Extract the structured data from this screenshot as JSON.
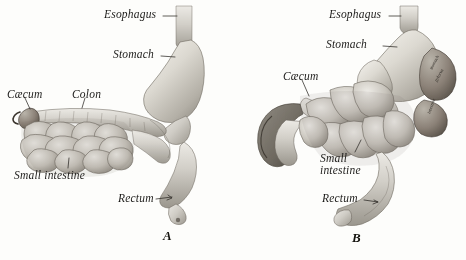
{
  "plate": {
    "background_color": "#fdfdfb",
    "ink_color": "#1d1c1a",
    "medium": "halftone engraving",
    "subject": "comparative digestive tract anatomy",
    "panel_count": 2
  },
  "figures": [
    {
      "caption": "A",
      "caption_x": 163,
      "caption_y": 232,
      "labels": [
        {
          "text": "Esophagus",
          "x": 104,
          "y": 12,
          "anchor_x": 176,
          "anchor_y": 18,
          "leader": "dash-right"
        },
        {
          "text": "Stomach",
          "x": 113,
          "y": 52,
          "anchor_x": 176,
          "anchor_y": 58,
          "leader": "dash-right"
        },
        {
          "text": "Cæcum",
          "x": 7,
          "y": 92,
          "anchor_x": 28,
          "anchor_y": 112,
          "leader": "down-right"
        },
        {
          "text": "Colon",
          "x": 72,
          "y": 92,
          "anchor_x": 84,
          "anchor_y": 110,
          "leader": "down-left"
        },
        {
          "text": "Small intestine",
          "x": 14,
          "y": 172,
          "anchor_x": 68,
          "anchor_y": 162,
          "leader": "up"
        },
        {
          "text": "Rectum",
          "x": 122,
          "y": 196,
          "anchor_x": 172,
          "anchor_y": 198,
          "leader": "dash-right"
        }
      ]
    },
    {
      "caption": "B",
      "caption_x": 352,
      "caption_y": 234,
      "labels": [
        {
          "text": "Esophagus",
          "x": 330,
          "y": 12,
          "anchor_x": 400,
          "anchor_y": 18,
          "leader": "dash-right"
        },
        {
          "text": "Stomach",
          "x": 327,
          "y": 42,
          "anchor_x": 392,
          "anchor_y": 48,
          "leader": "dash-right"
        },
        {
          "text": "Cæcum",
          "x": 283,
          "y": 74,
          "anchor_x": 307,
          "anchor_y": 96,
          "leader": "down-right"
        },
        {
          "text": "Small",
          "text_line2": "intestine",
          "x": 320,
          "y": 156,
          "anchor_x": 358,
          "anchor_y": 150,
          "leader": "up-right"
        },
        {
          "text": "Rectum",
          "x": 326,
          "y": 196,
          "anchor_x": 372,
          "anchor_y": 204,
          "leader": "dash-right"
        }
      ],
      "inline_organ_text": [
        {
          "text": "stomach",
          "x": 432,
          "y": 70,
          "rotate": -62
        },
        {
          "text": "pylorus",
          "x": 437,
          "y": 82,
          "rotate": -62
        },
        {
          "text": "intestine",
          "x": 430,
          "y": 112,
          "rotate": -70
        }
      ]
    }
  ],
  "icons": {
    "leader_line": "leader-line",
    "caption_marker": "figure-caption"
  }
}
